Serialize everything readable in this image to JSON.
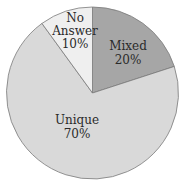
{
  "chart_data": {
    "type": "pie",
    "title": "",
    "categories": [
      "Mixed",
      "Unique",
      "No Answer"
    ],
    "values": [
      20,
      70,
      10
    ],
    "labels": [
      "Mixed\n20%",
      "Unique\n70%",
      "No\nAnswer\n10%"
    ],
    "colors": [
      "#a6a6a6",
      "#d9d9d9",
      "#efefef"
    ],
    "start_angle_deg": 0,
    "direction": "clockwise",
    "legend": "none"
  },
  "slices": [
    {
      "name": "Mixed",
      "line1": "Mixed",
      "line2": "20%"
    },
    {
      "name": "Unique",
      "line1": "Unique",
      "line2": "70%"
    },
    {
      "name": "No Answer",
      "line1": "No",
      "line2": "Answer",
      "line3": "10%"
    }
  ]
}
